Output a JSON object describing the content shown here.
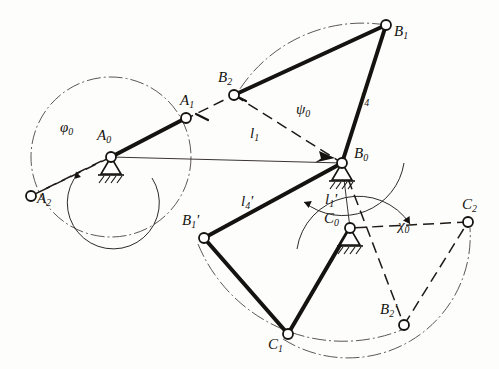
{
  "figure": {
    "type": "kinematic-linkage-diagram",
    "background_color": "#fdfdfc",
    "ink_color": "#15130f",
    "thin_color": "#4a4540"
  },
  "joints": [
    {
      "id": "A0",
      "base": "A",
      "sub": "0",
      "x": 111,
      "y": 157,
      "kind": "ground-pivot",
      "label_dx": -14,
      "label_dy": -30
    },
    {
      "id": "A1",
      "base": "A",
      "sub": "1",
      "x": 186,
      "y": 118,
      "kind": "pin",
      "label_dx": -6,
      "label_dy": -26
    },
    {
      "id": "A2",
      "base": "A",
      "sub": "2",
      "x": 31,
      "y": 196,
      "kind": "pin",
      "label_dx": 6,
      "label_dy": -6
    },
    {
      "id": "B0",
      "base": "B",
      "sub": "0",
      "x": 342,
      "y": 163,
      "kind": "ground-pivot",
      "label_dx": 12,
      "label_dy": -18
    },
    {
      "id": "B1",
      "base": "B",
      "sub": "1",
      "x": 386,
      "y": 25,
      "kind": "pin",
      "label_dx": 8,
      "label_dy": -2
    },
    {
      "id": "B2",
      "base": "B",
      "sub": "2",
      "x": 234,
      "y": 95,
      "kind": "pin",
      "label_dx": -16,
      "label_dy": -26
    },
    {
      "id": "B1p",
      "base": "B",
      "sub": "1",
      "prime": "'",
      "x": 204,
      "y": 238,
      "kind": "pin",
      "label_dx": -22,
      "label_dy": -26
    },
    {
      "id": "B2p",
      "base": "B",
      "sub": "2",
      "prime": "'",
      "x": 404,
      "y": 325,
      "kind": "pin",
      "label_dx": -24,
      "label_dy": -24
    },
    {
      "id": "C0",
      "base": "C",
      "sub": "0",
      "x": 350,
      "y": 228,
      "kind": "ground-pivot",
      "label_dx": -26,
      "label_dy": -18
    },
    {
      "id": "C1",
      "base": "C",
      "sub": "1",
      "x": 288,
      "y": 334,
      "kind": "pin",
      "label_dx": -20,
      "label_dy": 2
    },
    {
      "id": "C2",
      "base": "C",
      "sub": "2",
      "x": 468,
      "y": 222,
      "kind": "pin",
      "label_dx": -6,
      "label_dy": -26
    }
  ],
  "length_labels": [
    {
      "id": "l1",
      "base": "l",
      "sub": "1",
      "prime": "",
      "x": 256,
      "y": 133,
      "text": "l1"
    },
    {
      "id": "l4",
      "base": "l",
      "sub": "4",
      "prime": "",
      "x": 364,
      "y": 98,
      "text": "l4"
    },
    {
      "id": "l4p",
      "base": "l",
      "sub": "4",
      "prime": "'",
      "x": 247,
      "y": 202,
      "text": "l4'"
    },
    {
      "id": "l1p",
      "base": "l",
      "sub": "1",
      "prime": "'",
      "x": 330,
      "y": 199,
      "text": "l1'"
    }
  ],
  "angle_labels": [
    {
      "id": "phi0",
      "glyph": "φ",
      "sub": "0",
      "x": 66,
      "y": 128,
      "name": "phi-zero"
    },
    {
      "id": "psi0",
      "glyph": "ψ",
      "sub": "0",
      "x": 301,
      "y": 110,
      "name": "psi-zero"
    },
    {
      "id": "chi0",
      "glyph": "χ",
      "sub": "0",
      "x": 403,
      "y": 225,
      "name": "chi-zero"
    }
  ],
  "links": [
    {
      "id": "crank-A0-A1",
      "from": "A0",
      "to": "A1",
      "style": "thick-solid",
      "name": "crank-link"
    },
    {
      "id": "coupler-B2-B1",
      "from": "B2",
      "to": "B1",
      "style": "thick-solid",
      "name": "coupler-link-upper"
    },
    {
      "id": "rocker-B1-B0",
      "from": "B1",
      "to": "B0",
      "style": "thick-solid",
      "name": "rocker-link-l4"
    },
    {
      "id": "rocker-B0-B1p",
      "from": "B0",
      "to": "B1p",
      "style": "thick-solid",
      "name": "rocker-link-l4-prime"
    },
    {
      "id": "coupler-B1p-C1",
      "from": "B1p",
      "to": "C1",
      "style": "thick-solid",
      "name": "coupler-link-lower"
    },
    {
      "id": "rocker-C1-C0",
      "from": "C1",
      "to": "C0",
      "style": "thick-solid",
      "name": "rocker-link-c"
    },
    {
      "id": "frame-A0-B0",
      "from": "A0",
      "to": "B0",
      "style": "thin-solid",
      "name": "frame-line-l1"
    },
    {
      "id": "frame-B0-C0",
      "from": "B0",
      "to": "C0",
      "style": "thin-solid",
      "name": "frame-line-l1-prime"
    },
    {
      "id": "dash-A0-A2",
      "from": "A0",
      "to": "A2",
      "style": "dashed",
      "name": "crank-position-2"
    },
    {
      "id": "dash-A2-B2",
      "from": "A2",
      "to": "B2",
      "style": "dashed",
      "name": "coupler-position-2"
    },
    {
      "id": "dash-B2-B0",
      "from": "B2",
      "to": "B0",
      "style": "dashed",
      "name": "rocker-position-2"
    },
    {
      "id": "dash-B0-B2p",
      "from": "B0",
      "to": "B2p",
      "style": "dashed",
      "name": "rocker-prime-position-2"
    },
    {
      "id": "dash-B2p-C2",
      "from": "B2p",
      "to": "C2",
      "style": "dashed",
      "name": "coupler-prime-position-2"
    },
    {
      "id": "dash-C2-C0",
      "from": "C2",
      "to": "C0",
      "style": "dashed",
      "name": "rocker-c-position-2"
    }
  ],
  "arcs": [
    {
      "id": "crank-circle",
      "center": "A0",
      "r": 80,
      "kind": "dash-dot-circle",
      "name": "crank-path-circle"
    },
    {
      "id": "phi-arc",
      "center": "A0",
      "r": 46,
      "kind": "thin-arc-arrow",
      "name": "phi-angle-arc"
    },
    {
      "id": "B-path-arc",
      "center": "B0",
      "r": 147,
      "kind": "dash-dot-arc",
      "name": "b-point-path-arc"
    },
    {
      "id": "psi-arc",
      "center": "B0",
      "r": 62,
      "kind": "thin-arc-arrow",
      "name": "psi-angle-arc"
    },
    {
      "id": "Bp-path-arc",
      "center": "B0",
      "r": 155,
      "kind": "dash-dot-arc",
      "name": "b-prime-path-arc"
    },
    {
      "id": "C-path-arc",
      "center": "C0",
      "r": 122,
      "kind": "dash-dot-arc",
      "name": "c-point-path-arc"
    },
    {
      "id": "chi-arc",
      "center": "C0",
      "r": 62,
      "kind": "thin-arc-arrow",
      "name": "chi-angle-arc"
    }
  ]
}
